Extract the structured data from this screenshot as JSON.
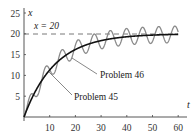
{
  "chart_data": {
    "type": "line",
    "title": "",
    "xlabel": "t",
    "ylabel": "x",
    "xlim": [
      0,
      62
    ],
    "ylim": [
      0,
      25
    ],
    "grid": false,
    "legend": "none (curves labelled by leader-line annotations)",
    "x_ticks": [
      10,
      20,
      30,
      40,
      50,
      60
    ],
    "y_ticks": [
      5,
      10,
      15,
      20,
      25
    ],
    "x_tick_labels": [
      "10",
      "20",
      "30",
      "40",
      "50",
      "60"
    ],
    "y_tick_labels": [
      "5",
      "10",
      "15",
      "20",
      "25"
    ],
    "reference_line": {
      "y": 20,
      "style": "dashed",
      "label": "x = 20"
    },
    "series": [
      {
        "name": "Problem 45",
        "color": "#111111",
        "description": "smooth monotone curve approaching x = 20",
        "x": [
          0,
          5,
          10,
          15,
          20,
          25,
          30,
          35,
          40,
          45,
          50,
          55,
          60
        ],
        "values": [
          0,
          6.8,
          11.3,
          14.3,
          16.2,
          17.5,
          18.4,
          18.9,
          19.3,
          19.5,
          19.7,
          19.8,
          19.9
        ]
      },
      {
        "name": "Problem 46",
        "color": "#8a8a8a",
        "description": "oscillating curve (period ≈ 2π, amplitude ≈ 2) about the Problem 45 curve, approaching oscillation about x = 20",
        "x": [
          0,
          5,
          10,
          15,
          20,
          25,
          30,
          35,
          40,
          45,
          50,
          55,
          60
        ],
        "values": [
          0,
          5.0,
          10.3,
          15.6,
          18.0,
          15.8,
          16.8,
          18.1,
          20.9,
          21.2,
          18.1,
          17.8,
          19.3
        ]
      }
    ],
    "annotations": [
      {
        "text": "x = 20",
        "near": "dashed line at x = 20"
      },
      {
        "text": "Problem 46",
        "points_to": "oscillating gray curve"
      },
      {
        "text": "Problem 45",
        "points_to": "smooth black curve"
      }
    ]
  },
  "labels": {
    "x_axis": "t",
    "y_axis": "x",
    "ref_line": "x = 20",
    "problem46": "Problem 46",
    "problem45": "Problem 45",
    "xt": [
      "10",
      "20",
      "30",
      "40",
      "50",
      "60"
    ],
    "yt": [
      "5",
      "10",
      "15",
      "20",
      "25"
    ]
  },
  "colors": {
    "axis": "#444444",
    "problem45": "#111111",
    "problem46": "#8a8a8a",
    "dash": "#555555",
    "leader": "#555555"
  }
}
